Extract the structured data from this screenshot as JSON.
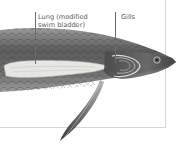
{
  "figure": {
    "labels": [
      {
        "id": "lung",
        "line1": "Lung (modified",
        "line2": "swim bladder)"
      },
      {
        "id": "gills",
        "text": "Gills"
      }
    ]
  },
  "colors": {
    "background": "#ffffff",
    "frame": "#d6d6d6",
    "label_text": "#5a5a5a",
    "leader_line": "#6b6b6b",
    "body_dark": "#4a4a4a",
    "body_mid": "#8a8a8a",
    "lung_fill": "#e6e6e2"
  }
}
